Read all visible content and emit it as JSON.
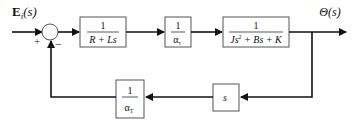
{
  "diagram": {
    "type": "block-diagram",
    "input": {
      "label_main": "E",
      "label_sub": "i",
      "label_arg": "(s)"
    },
    "output": {
      "label": "Θ(s)"
    },
    "summing_junction": {
      "plus_sign": "+",
      "minus_sign": "−"
    },
    "forward_blocks": [
      {
        "id": "electrical",
        "numerator": "1",
        "denominator": "R + Ls"
      },
      {
        "id": "torque-constant",
        "numerator": "1",
        "denominator_main": "α",
        "denominator_sub": "τ"
      },
      {
        "id": "mechanical",
        "numerator": "1",
        "denominator_pre": "Js",
        "denominator_exp": "2",
        "denominator_post": " + Bs + K"
      }
    ],
    "feedback_blocks": [
      {
        "id": "differentiator",
        "label": "s"
      },
      {
        "id": "back-emf-constant",
        "numerator": "1",
        "denominator_main": "α",
        "denominator_sub": "T"
      }
    ],
    "colors": {
      "line": "#111111",
      "box_border": "#555555",
      "background": "#ffffff"
    }
  }
}
